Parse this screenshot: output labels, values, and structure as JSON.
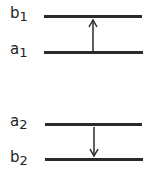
{
  "diagram": {
    "groups": [
      {
        "upper": {
          "letter": "b",
          "sub": "1"
        },
        "lower": {
          "letter": "a",
          "sub": "1"
        },
        "arrow_direction": "up"
      },
      {
        "upper": {
          "letter": "a",
          "sub": "2"
        },
        "lower": {
          "letter": "b",
          "sub": "2"
        },
        "arrow_direction": "down"
      }
    ],
    "line_color": "#2a2a2a"
  }
}
